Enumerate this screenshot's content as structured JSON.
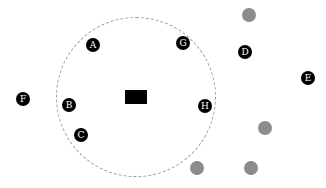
{
  "diagram": {
    "colors": {
      "background": "#ffffff",
      "ring": "#9a9a9a",
      "marker": "#000000",
      "marker_text": "#ffffff",
      "dot": "#8c8c8c",
      "center_rect": "#000000"
    },
    "ring": {
      "cx": 136,
      "cy": 97,
      "r": 80,
      "style": "dashed"
    },
    "center_rect": {
      "x": 125,
      "y": 90,
      "w": 22,
      "h": 14
    },
    "markers": [
      {
        "label": "A",
        "x": 93,
        "y": 45
      },
      {
        "label": "B",
        "x": 69,
        "y": 105
      },
      {
        "label": "C",
        "x": 81,
        "y": 135
      },
      {
        "label": "D",
        "x": 245,
        "y": 52
      },
      {
        "label": "E",
        "x": 308,
        "y": 78
      },
      {
        "label": "F",
        "x": 23,
        "y": 99
      },
      {
        "label": "G",
        "x": 183,
        "y": 43
      },
      {
        "label": "H",
        "x": 205,
        "y": 106
      }
    ],
    "marker_size": 14,
    "dots": [
      {
        "x": 249,
        "y": 15
      },
      {
        "x": 265,
        "y": 128
      },
      {
        "x": 197,
        "y": 168
      },
      {
        "x": 251,
        "y": 168
      }
    ],
    "dot_size": 14
  }
}
